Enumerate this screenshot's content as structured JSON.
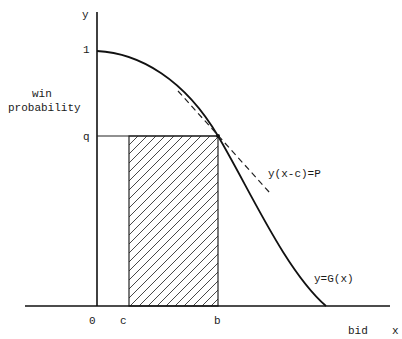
{
  "chart_data": {
    "type": "diagram",
    "title": "",
    "axes": {
      "x_label": "x",
      "x_caption": "bid",
      "y_label": "y",
      "y_caption_line1": "win",
      "y_caption_line2": "probability"
    },
    "y_ticks": {
      "one": "1",
      "q": "q"
    },
    "x_ticks": {
      "zero": "0",
      "c": "c",
      "b": "b"
    },
    "curve": {
      "label": "y=G(x)",
      "description": "decreasing win probability curve from y=1 at x=0 to 0"
    },
    "tangent": {
      "label": "y(x-c)=P",
      "style": "dashed",
      "touches_at": "(b, q)"
    },
    "shaded_region": {
      "x_from": "c",
      "x_to": "b",
      "y_from": "0",
      "y_to": "q",
      "pattern": "diagonal hatch"
    }
  }
}
